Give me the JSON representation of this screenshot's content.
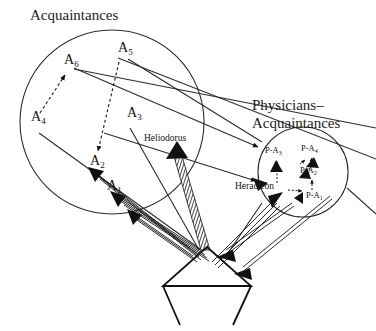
{
  "figure": {
    "kind": "network-diagram",
    "background_color": "#ffffff",
    "line_color": "#2b2b2b",
    "text_color": "#111111"
  },
  "groups": {
    "acquaintances": {
      "title": "Acquaintances",
      "title_x": 30,
      "title_y": 20
    },
    "physicians_acquaintances": {
      "title_line1": "Physicians–",
      "title_line2": "Acquaintances",
      "title_x": 252,
      "title_y": 110
    }
  },
  "nodes": {
    "acquaintance_nodes": [
      {
        "id": "A6",
        "base": "A",
        "sub": "6",
        "x": 64,
        "y": 64
      },
      {
        "id": "A5",
        "base": "A",
        "sub": "5",
        "x": 118,
        "y": 52
      },
      {
        "id": "A4",
        "base": "A",
        "sub": "4",
        "x": 31,
        "y": 121
      },
      {
        "id": "A3",
        "base": "A",
        "sub": "3",
        "x": 127,
        "y": 117
      },
      {
        "id": "A2",
        "base": "A",
        "sub": "2",
        "x": 90,
        "y": 165
      },
      {
        "id": "A1",
        "base": "A",
        "sub": "1",
        "x": 107,
        "y": 190
      }
    ],
    "named_nodes": [
      {
        "id": "heliodorus",
        "label": "Heliodorus",
        "x": 144,
        "y": 141
      },
      {
        "id": "heracleon",
        "label": "Heracleon",
        "x": 262,
        "y": 186
      }
    ],
    "physician_acquaintance_nodes": [
      {
        "id": "PA3",
        "base": "P-A",
        "sub": "3",
        "x": 268,
        "y": 152
      },
      {
        "id": "PA4",
        "base": "P-A",
        "sub": "4",
        "x": 306,
        "y": 150
      },
      {
        "id": "PA2",
        "base": "P-A",
        "sub": "2",
        "x": 305,
        "y": 172
      },
      {
        "id": "PA1",
        "base": "P-A",
        "sub": "1",
        "x": 310,
        "y": 196
      }
    ]
  },
  "shapes": {
    "big_circle": {
      "cx": 112,
      "cy": 122,
      "r": 92
    },
    "small_circle": {
      "cx": 303,
      "cy": 172,
      "r": 45
    },
    "center_figure": {
      "name": "diamond-with-crossbar",
      "apex_x": 207,
      "apex_y": 247,
      "left_x": 163,
      "right_x": 251,
      "mid_y": 286,
      "bottom_left_x": 180,
      "bottom_right_x": 233,
      "bottom_y": 325
    }
  },
  "edges": {
    "dashed_internal": [
      {
        "from": "A4",
        "to": "A6"
      },
      {
        "from": "A5",
        "to": "A2"
      }
    ],
    "plain_cross": [
      {
        "from": "A6",
        "to": "PA3"
      },
      {
        "from": "A5",
        "to": "PA3-region"
      },
      {
        "from": "A4",
        "to": "center"
      },
      {
        "from": "A3",
        "to": "center"
      }
    ],
    "hatched": [
      {
        "from": "center",
        "to": "heliodorus"
      }
    ],
    "bundled": [
      {
        "from": "center",
        "to": "A1"
      },
      {
        "from": "center",
        "to": "A2"
      },
      {
        "from": "center",
        "to": "heracleon"
      }
    ],
    "dashed_small_circle": [
      {
        "from": "heracleon",
        "to": "PA3"
      },
      {
        "from": "heracleon",
        "to": "PA1"
      },
      {
        "from": "PA2",
        "to": "PA4"
      },
      {
        "from": "PA1",
        "to": "PA2"
      }
    ]
  }
}
